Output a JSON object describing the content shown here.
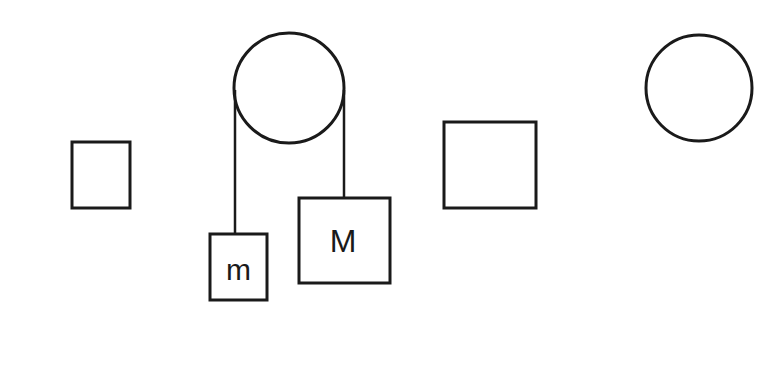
{
  "diagram": {
    "labels": {
      "small_mass": "m",
      "large_mass": "M"
    },
    "components": [
      {
        "id": "standalone-small-box",
        "kind": "rectangle"
      },
      {
        "id": "pulley",
        "kind": "circle"
      },
      {
        "id": "mass-m",
        "kind": "rectangle",
        "label": "m"
      },
      {
        "id": "mass-M",
        "kind": "rectangle",
        "label": "M"
      },
      {
        "id": "standalone-large-box",
        "kind": "rectangle"
      },
      {
        "id": "standalone-circle",
        "kind": "circle"
      }
    ],
    "colors": {
      "line": "#1a1a1a",
      "background": "#ffffff"
    }
  }
}
